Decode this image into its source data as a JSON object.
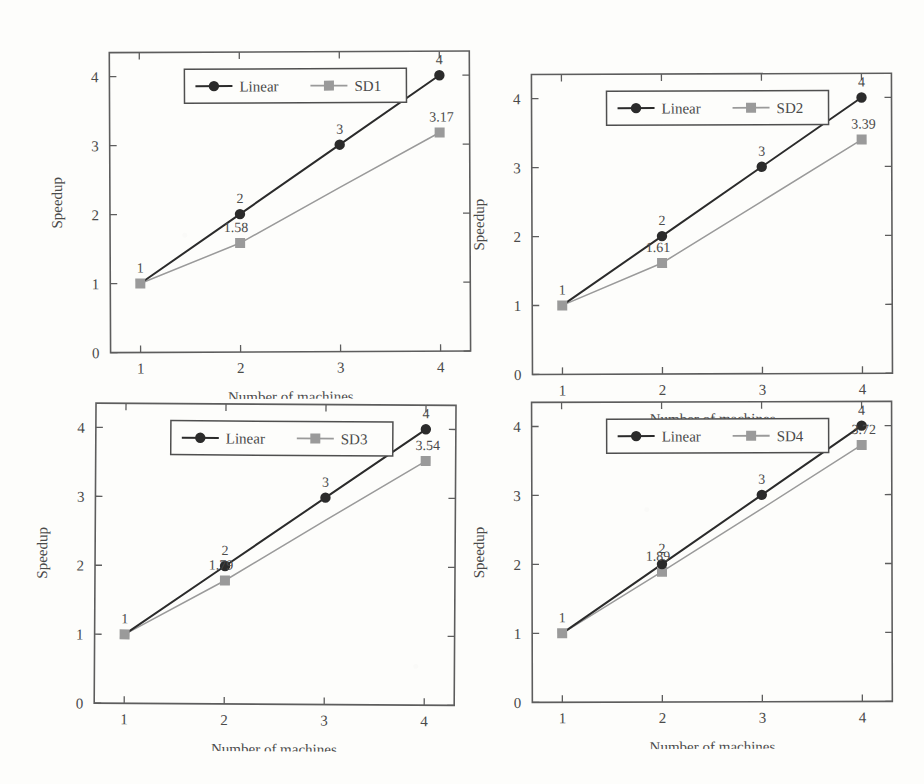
{
  "figure": {
    "background_color": "#fdfdfb",
    "linear_color": "#2b2b2b",
    "sd_color": "#9a9a9a",
    "panel_count": 4
  },
  "panels": [
    {
      "id": "panel-sd1",
      "series_name": "SD1",
      "legend": {
        "linear_label": "Linear",
        "sd_label": "SD1"
      },
      "xlabel": "Number of machines",
      "ylabel": "Speedup",
      "xticks": [
        "1",
        "2",
        "3",
        "4"
      ],
      "yticks": [
        "0",
        "1",
        "2",
        "3",
        "4"
      ],
      "linear_labels": [
        "1",
        "2",
        "3",
        "4"
      ],
      "sd_labels": [
        "",
        "1.58",
        "",
        "3.17"
      ],
      "chart_data": {
        "type": "line",
        "title": "",
        "xlabel": "Number of machines",
        "ylabel": "Speedup",
        "x": [
          1,
          2,
          3,
          4
        ],
        "xlim": [
          0.7,
          4.3
        ],
        "ylim": [
          0,
          4.35
        ],
        "grid": false,
        "legend_position": "top-center",
        "series": [
          {
            "name": "Linear",
            "values": [
              1,
              2,
              3,
              4
            ],
            "point_labels": [
              "1",
              "2",
              "3",
              "4"
            ],
            "color": "#2b2b2b",
            "marker": "circle"
          },
          {
            "name": "SD1",
            "values": [
              1,
              1.58,
              2.38,
              3.17
            ],
            "point_labels": [
              "",
              "1.58",
              "",
              "3.17"
            ],
            "color": "#9a9a9a",
            "marker": "square"
          }
        ]
      }
    },
    {
      "id": "panel-sd2",
      "series_name": "SD2",
      "legend": {
        "linear_label": "Linear",
        "sd_label": "SD2"
      },
      "xlabel": "Number of machines",
      "ylabel": "Speedup",
      "xticks": [
        "1",
        "2",
        "3",
        "4"
      ],
      "yticks": [
        "0",
        "1",
        "2",
        "3",
        "4"
      ],
      "linear_labels": [
        "1",
        "2",
        "3",
        "4"
      ],
      "sd_labels": [
        "",
        "1.61",
        "",
        "3.39"
      ],
      "chart_data": {
        "type": "line",
        "title": "",
        "xlabel": "Number of machines",
        "ylabel": "Speedup",
        "x": [
          1,
          2,
          3,
          4
        ],
        "xlim": [
          0.7,
          4.3
        ],
        "ylim": [
          0,
          4.35
        ],
        "grid": false,
        "legend_position": "top-center",
        "series": [
          {
            "name": "Linear",
            "values": [
              1,
              2,
              3,
              4
            ],
            "point_labels": [
              "1",
              "2",
              "3",
              "4"
            ],
            "color": "#2b2b2b",
            "marker": "circle"
          },
          {
            "name": "SD2",
            "values": [
              1,
              1.61,
              2.5,
              3.39
            ],
            "point_labels": [
              "",
              "1.61",
              "",
              "3.39"
            ],
            "color": "#9a9a9a",
            "marker": "square"
          }
        ]
      }
    },
    {
      "id": "panel-sd3",
      "series_name": "SD3",
      "legend": {
        "linear_label": "Linear",
        "sd_label": "SD3"
      },
      "xlabel": "Number of machines",
      "ylabel": "Speedup",
      "xticks": [
        "1",
        "2",
        "3",
        "4"
      ],
      "yticks": [
        "0",
        "1",
        "2",
        "3",
        "4"
      ],
      "linear_labels": [
        "1",
        "2",
        "3",
        "4"
      ],
      "sd_labels": [
        "",
        "1.79",
        "",
        "3.54"
      ],
      "chart_data": {
        "type": "line",
        "title": "",
        "xlabel": "Number of machines",
        "ylabel": "Speedup",
        "x": [
          1,
          2,
          3,
          4
        ],
        "xlim": [
          0.7,
          4.3
        ],
        "ylim": [
          0,
          4.35
        ],
        "grid": false,
        "legend_position": "top-center",
        "series": [
          {
            "name": "Linear",
            "values": [
              1,
              2,
              3,
              4
            ],
            "point_labels": [
              "1",
              "2",
              "3",
              "4"
            ],
            "color": "#2b2b2b",
            "marker": "circle"
          },
          {
            "name": "SD3",
            "values": [
              1,
              1.79,
              2.67,
              3.54
            ],
            "point_labels": [
              "",
              "1.79",
              "",
              "3.54"
            ],
            "color": "#9a9a9a",
            "marker": "square"
          }
        ]
      }
    },
    {
      "id": "panel-sd4",
      "series_name": "SD4",
      "legend": {
        "linear_label": "Linear",
        "sd_label": "SD4"
      },
      "xlabel": "Number of machines",
      "ylabel": "Speedup",
      "xticks": [
        "1",
        "2",
        "3",
        "4"
      ],
      "yticks": [
        "0",
        "1",
        "2",
        "3",
        "4"
      ],
      "linear_labels": [
        "1",
        "2",
        "3",
        "4"
      ],
      "sd_labels": [
        "",
        "1.89",
        "",
        "3.72"
      ],
      "chart_data": {
        "type": "line",
        "title": "",
        "xlabel": "Number of machines",
        "ylabel": "Speedup",
        "x": [
          1,
          2,
          3,
          4
        ],
        "xlim": [
          0.7,
          4.3
        ],
        "ylim": [
          0,
          4.35
        ],
        "grid": false,
        "legend_position": "top-center",
        "series": [
          {
            "name": "Linear",
            "values": [
              1,
              2,
              3,
              4
            ],
            "point_labels": [
              "1",
              "2",
              "3",
              "4"
            ],
            "color": "#2b2b2b",
            "marker": "circle"
          },
          {
            "name": "SD4",
            "values": [
              1,
              1.89,
              2.8,
              3.72
            ],
            "point_labels": [
              "",
              "1.89",
              "",
              "3.72"
            ],
            "color": "#9a9a9a",
            "marker": "square"
          }
        ]
      }
    }
  ]
}
